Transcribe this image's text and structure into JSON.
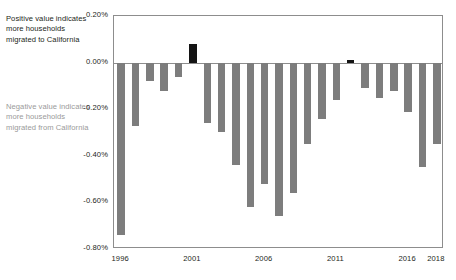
{
  "annotations": {
    "positive_note": "Positive value indicates more households migrated to California",
    "negative_note": "Negative value indicates more households migrated from California",
    "positive_color": "#231f20",
    "negative_color": "#9a9a9a"
  },
  "chart_data": {
    "type": "bar",
    "title": "",
    "subtitle": "",
    "xlabel": "",
    "ylabel": "",
    "ylim": [
      -0.8,
      0.2
    ],
    "xlim": [
      1996,
      2018
    ],
    "grid": false,
    "legend": null,
    "y_ticks": [
      "0.20%",
      "0.00%",
      "-0.20%",
      "-0.40%",
      "-0.60%",
      "-0.80%"
    ],
    "y_tick_values": [
      0.2,
      0.0,
      -0.2,
      -0.4,
      -0.6,
      -0.8
    ],
    "x_ticks": [
      "1996",
      "2001",
      "2006",
      "2011",
      "2016",
      "2018"
    ],
    "x_tick_values": [
      1996,
      2001,
      2006,
      2011,
      2016,
      2018
    ],
    "categories": [
      1996,
      1997,
      1998,
      1999,
      2000,
      2001,
      2002,
      2003,
      2004,
      2005,
      2006,
      2007,
      2008,
      2009,
      2010,
      2011,
      2012,
      2013,
      2014,
      2015,
      2016,
      2017,
      2018
    ],
    "values": [
      -0.74,
      -0.27,
      -0.08,
      -0.12,
      -0.06,
      0.08,
      -0.26,
      -0.3,
      -0.44,
      -0.62,
      -0.52,
      -0.66,
      -0.56,
      -0.35,
      -0.24,
      -0.16,
      0.01,
      -0.11,
      -0.15,
      -0.12,
      -0.21,
      -0.45,
      -0.35
    ],
    "bar_colors": {
      "negative": "#7d7d7d",
      "positive": "#141414"
    },
    "axis_color": "#8d8d8d"
  }
}
